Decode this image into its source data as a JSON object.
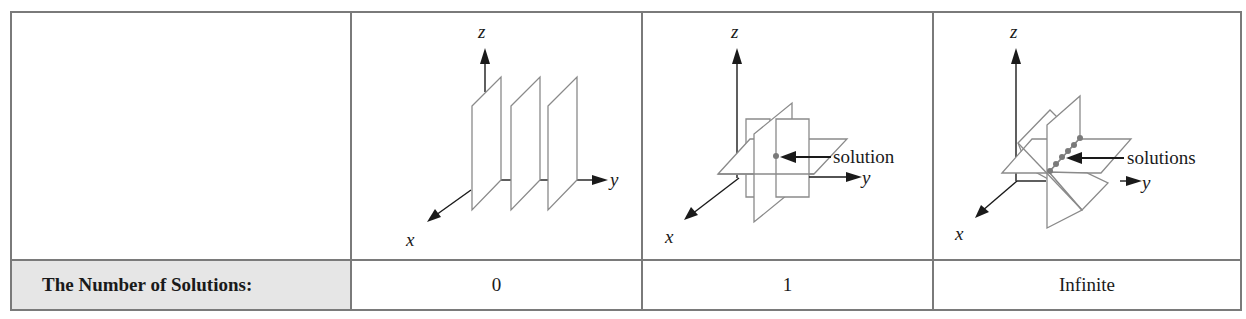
{
  "table": {
    "row_label": "The Number of Solutions:",
    "columns": [
      {
        "diagram": "three-parallel-planes",
        "value": "0",
        "axes": {
          "x": "x",
          "y": "y",
          "z": "z"
        },
        "annotation": ""
      },
      {
        "diagram": "three-planes-intersecting-at-point",
        "value": "1",
        "axes": {
          "x": "x",
          "y": "y",
          "z": "z"
        },
        "annotation": "solution"
      },
      {
        "diagram": "three-planes-intersecting-in-line",
        "value": "Infinite",
        "axes": {
          "x": "x",
          "y": "y",
          "z": "z"
        },
        "annotation": "solutions"
      }
    ]
  },
  "colors": {
    "border": "#7a7a7a",
    "label_bg": "#e6e6e6",
    "plane_stroke": "#8a8a8a",
    "solution_dot": "#7a7a7a"
  }
}
